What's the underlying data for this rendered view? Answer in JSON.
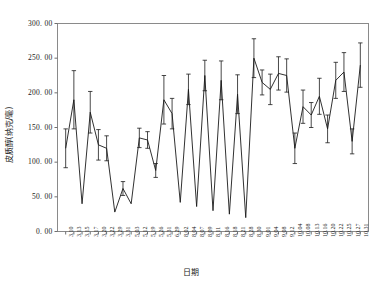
{
  "chart_data": {
    "type": "line",
    "title": "",
    "xlabel": "日期",
    "ylabel": "皮质醇(纳克/毫)",
    "ylim": [
      0,
      300
    ],
    "ytick_labels": [
      "0. 00",
      "50. 00",
      "100. 00",
      "150. 00",
      "200. 00",
      "250. 00",
      "300. 00"
    ],
    "ytick_values": [
      0,
      50,
      100,
      150,
      200,
      250,
      300
    ],
    "grid": false,
    "legend": null,
    "error_bars": true,
    "categories": [
      "3.10",
      "3.13",
      "3.15",
      "3.17",
      "3.20",
      "3.22",
      "3.29",
      "3.31",
      "5.03",
      "5.12",
      "5.19",
      "5.26",
      "5.31",
      "6.29",
      "8.02",
      "8.04",
      "8.07",
      "8.09",
      "8.11",
      "8.16",
      "8.18",
      "8.21",
      "8.28",
      "8.30",
      "9.01",
      "9.04",
      "9.08",
      "9.12",
      "10.04",
      "10.08",
      "10.13",
      "10.16",
      "10.20",
      "10.22",
      "10.25",
      "10.27",
      "10.31"
    ],
    "values": [
      120,
      190,
      40,
      172,
      125,
      120,
      28,
      62,
      40,
      135,
      132,
      88,
      190,
      170,
      42,
      205,
      36,
      225,
      30,
      218,
      25,
      198,
      20,
      250,
      215,
      205,
      228,
      225,
      120,
      180,
      168,
      195,
      148,
      218,
      230,
      130,
      240
    ],
    "errors": [
      28,
      42,
      0,
      30,
      22,
      18,
      0,
      10,
      0,
      14,
      12,
      10,
      35,
      22,
      0,
      22,
      0,
      22,
      0,
      28,
      0,
      28,
      0,
      28,
      18,
      22,
      24,
      24,
      22,
      24,
      18,
      26,
      20,
      26,
      28,
      18,
      32
    ]
  }
}
